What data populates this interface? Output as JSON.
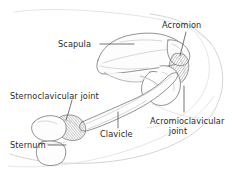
{
  "figure": {
    "background_color": "#ffffff",
    "line_color": "#6e6e6e",
    "text_color": "#2b2b2b",
    "contour_color": "#c9c9c9"
  },
  "labels": {
    "scapula": "Scapula",
    "acromion": "Acromion",
    "sternoclavicular_joint": "Sternoclavicular joint",
    "clavicle": "Clavicle",
    "sternum": "Sternum",
    "acromioclavicular_joint_line1": "Acromioclavicular",
    "acromioclavicular_joint_line2": "joint"
  }
}
